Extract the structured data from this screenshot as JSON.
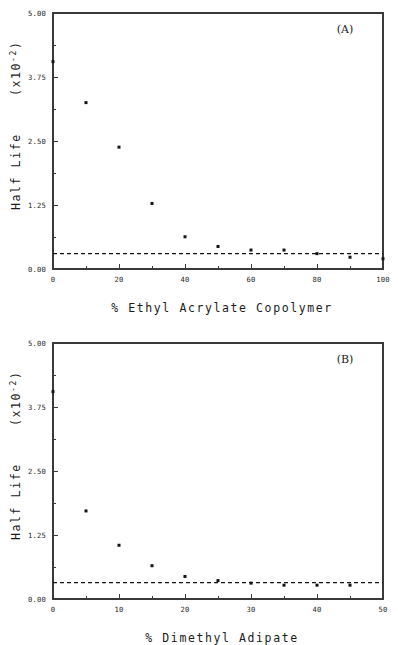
{
  "figure": {
    "background": "#ffffff",
    "ink_color": "#141414",
    "panels": [
      "A",
      "B"
    ]
  },
  "chart_data": [
    {
      "type": "scatter",
      "panel_label": "(A)",
      "title": "",
      "xlabel": "% Ethyl Acrylate Copolymer",
      "ylabel": "Half Life  (x10",
      "ylabel_exponent": "-2",
      "ylabel_suffix": ")",
      "ylabel_full": "Half Life  (x10-2)",
      "xlim": [
        0,
        100
      ],
      "ylim": [
        0.0,
        5.0
      ],
      "xticks": [
        0,
        20,
        40,
        60,
        80,
        100
      ],
      "xticklabels": [
        "0",
        "20",
        "40",
        "60",
        "80",
        "100"
      ],
      "xminorticks": [
        10,
        30,
        50,
        70,
        90
      ],
      "yticks": [
        0.0,
        1.25,
        2.5,
        3.75,
        5.0
      ],
      "yticklabels": [
        "0.00",
        "1.25",
        "2.50",
        "3.75",
        "5.00"
      ],
      "grid": false,
      "legend": "none",
      "x": [
        0,
        10,
        20,
        30,
        40,
        50,
        60,
        70,
        80,
        90,
        100
      ],
      "y": [
        4.05,
        3.25,
        2.38,
        1.28,
        0.63,
        0.44,
        0.37,
        0.37,
        0.3,
        0.23,
        0.2
      ],
      "marker": "square",
      "marker_size": 3,
      "reference_line": {
        "type": "horizontal-dashed",
        "value": 0.3,
        "style": "dashed",
        "color": "#141414"
      }
    },
    {
      "type": "scatter",
      "panel_label": "(B)",
      "title": "",
      "xlabel": "% Dimethyl Adipate",
      "ylabel": "Half Life  (x10",
      "ylabel_exponent": "-2",
      "ylabel_suffix": ")",
      "ylabel_full": "Half Life  (x10-2)",
      "xlim": [
        0,
        50
      ],
      "ylim": [
        0.0,
        5.0
      ],
      "xticks": [
        0,
        10,
        20,
        30,
        40,
        50
      ],
      "xticklabels": [
        "0",
        "10",
        "20",
        "30",
        "40",
        "50"
      ],
      "xminorticks": [
        5,
        15,
        25,
        35,
        45
      ],
      "yticks": [
        0.0,
        1.25,
        2.5,
        3.75,
        5.0
      ],
      "yticklabels": [
        "0.00",
        "1.25",
        "2.50",
        "3.75",
        "5.00"
      ],
      "grid": false,
      "legend": "none",
      "x": [
        0,
        5,
        10,
        15,
        20,
        25,
        30,
        35,
        40,
        45
      ],
      "y": [
        4.05,
        1.72,
        1.05,
        0.65,
        0.44,
        0.36,
        0.31,
        0.27,
        0.27,
        0.27
      ],
      "marker": "square",
      "marker_size": 3,
      "reference_line": {
        "type": "horizontal-dashed",
        "value": 0.32,
        "style": "dashed",
        "color": "#141414"
      }
    }
  ]
}
